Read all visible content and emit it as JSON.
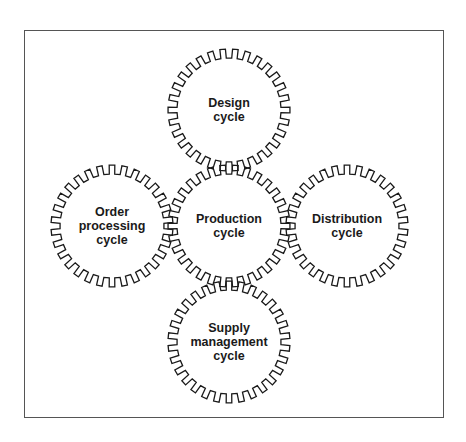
{
  "diagram": {
    "frame": {
      "x": 24,
      "y": 30,
      "width": 420,
      "height": 388
    },
    "gear_style": {
      "stroke": "#1a1a1a",
      "fill": "#ffffff",
      "stroke_width": 1.3,
      "teeth": 30,
      "outer_radius": 61,
      "inner_radius": 52
    },
    "gears": [
      {
        "id": "design",
        "cx": 229,
        "cy": 110,
        "rotation": 0,
        "lines": [
          "Design",
          "cycle"
        ]
      },
      {
        "id": "order-processing",
        "cx": 112,
        "cy": 226,
        "rotation": 6,
        "lines": [
          "Order",
          "processing",
          "cycle"
        ]
      },
      {
        "id": "production",
        "cx": 229,
        "cy": 226,
        "rotation": 0,
        "lines": [
          "Production",
          "cycle"
        ]
      },
      {
        "id": "distribution",
        "cx": 347,
        "cy": 226,
        "rotation": 6,
        "lines": [
          "Distribution",
          "cycle"
        ]
      },
      {
        "id": "supply-management",
        "cx": 229,
        "cy": 342,
        "rotation": 6,
        "lines": [
          "Supply",
          "management",
          "cycle"
        ]
      }
    ]
  }
}
